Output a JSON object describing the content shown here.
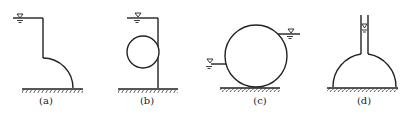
{
  "figures": [
    {
      "id": "a",
      "label": "(a)",
      "description": "Vertical wall with quarter-circle curved surface, water on left side"
    },
    {
      "id": "b",
      "label": "(b)",
      "description": "Circular body attached to vertical wall, water on left side"
    },
    {
      "id": "c",
      "label": "(c)",
      "description": "Cylinder resting on ground with water on both sides at different levels"
    },
    {
      "id": "d",
      "label": "(d)",
      "description": "Hemispherical dome with narrow vertical tube filled with water"
    }
  ],
  "colors": {
    "stroke": "#222222",
    "background": "#ffffff"
  }
}
